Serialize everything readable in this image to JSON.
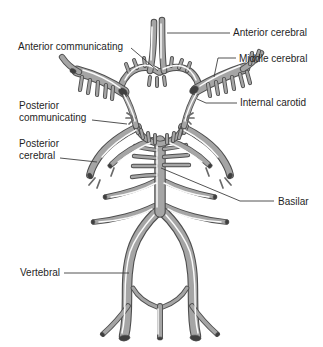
{
  "colors": {
    "vessel_fill": "#a5a5a5",
    "vessel_outline": "#4e4e4e",
    "vessel_highlight": "#ffffff",
    "vessel_cut_end": "#3f3f3f",
    "twig": "#6a6a6a",
    "leader_line": "#404040",
    "label_text": "#1f1f1f",
    "background": "#ffffff"
  },
  "labels": [
    {
      "id": "anterior-communicating",
      "text": "Anterior communicating"
    },
    {
      "id": "anterior-cerebral",
      "text": "Anterior cerebral"
    },
    {
      "id": "middle-cerebral",
      "text": "Middle cerebral"
    },
    {
      "id": "internal-carotid",
      "text": "Internal carotid"
    },
    {
      "id": "posterior-communicating",
      "text": "Posterior\ncommunicating"
    },
    {
      "id": "posterior-cerebral",
      "text": "Posterior\ncerebral"
    },
    {
      "id": "basilar",
      "text": "Basilar"
    },
    {
      "id": "vertebral",
      "text": "Vertebral"
    }
  ]
}
